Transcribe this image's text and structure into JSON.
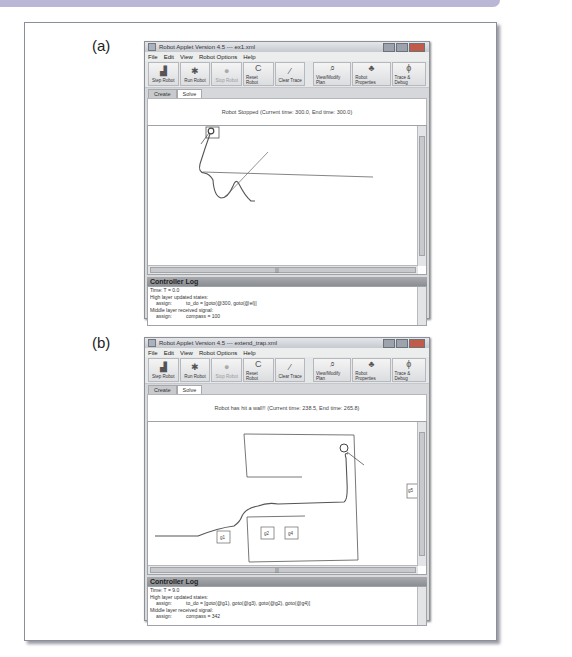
{
  "figure": {
    "panels": [
      {
        "label": "(a)",
        "window": {
          "title": "Robot Applet Version 4.5 --- ex1.xml",
          "menu": [
            "File",
            "Edit",
            "View",
            "Robot Options",
            "Help"
          ],
          "toolbar": [
            {
              "label": "Step Robot",
              "icon": "bar-chart-icon",
              "glyph": "▟",
              "enabled": true
            },
            {
              "label": "Run Robot",
              "icon": "running-man-icon",
              "glyph": "🏃",
              "enabled": true
            },
            {
              "label": "Stop Robot",
              "icon": "stop-circle-icon",
              "glyph": "●",
              "enabled": false
            },
            {
              "label": "Reset Robot",
              "icon": "reset-icon",
              "glyph": "C",
              "enabled": true
            },
            {
              "label": "Clear Trace",
              "icon": "pen-icon",
              "glyph": "⁄",
              "enabled": true
            },
            {
              "label": "View/Modify Plan",
              "icon": "magnifier-icon",
              "glyph": "⌕",
              "enabled": true
            },
            {
              "label": "Robot Properties",
              "icon": "robot-icon",
              "glyph": "♣",
              "enabled": true
            },
            {
              "label": "Trace & Debug",
              "icon": "bug-icon",
              "glyph": "ϕ",
              "enabled": true
            }
          ],
          "tabs": [
            {
              "label": "Create",
              "active": false
            },
            {
              "label": "Solve",
              "active": true
            }
          ],
          "status": "Robot Stopped (Current time: 300.0, End time: 300.0)",
          "log": {
            "title": "Controller Log",
            "lines": [
              {
                "text": "Time:   T = 0.0",
                "indent": false
              },
              {
                "text": "High layer updated states:",
                "indent": false
              },
              {
                "key": "assign:",
                "value": "to_do = [goto(@300, goto(@el)]",
                "indent": true
              },
              {
                "text": "Middle layer received signal:",
                "indent": false
              },
              {
                "key": "assign:",
                "value": "compass = 100",
                "indent": true
              }
            ]
          }
        }
      },
      {
        "label": "(b)",
        "window": {
          "title": "Robot Applet Version 4.5 --- extend_trap.xml",
          "menu": [
            "File",
            "Edit",
            "View",
            "Robot Options",
            "Help"
          ],
          "toolbar": [
            {
              "label": "Step Robot",
              "icon": "bar-chart-icon",
              "glyph": "▟",
              "enabled": true
            },
            {
              "label": "Run Robot",
              "icon": "running-man-icon",
              "glyph": "🏃",
              "enabled": true
            },
            {
              "label": "Stop Robot",
              "icon": "stop-circle-icon",
              "glyph": "●",
              "enabled": false
            },
            {
              "label": "Reset Robot",
              "icon": "reset-icon",
              "glyph": "C",
              "enabled": true
            },
            {
              "label": "Clear Trace",
              "icon": "pen-icon",
              "glyph": "⁄",
              "enabled": true
            },
            {
              "label": "View/Modify Plan",
              "icon": "magnifier-icon",
              "glyph": "⌕",
              "enabled": true
            },
            {
              "label": "Robot Properties",
              "icon": "robot-icon",
              "glyph": "♣",
              "enabled": true
            },
            {
              "label": "Trace & Debug",
              "icon": "bug-icon",
              "glyph": "ϕ",
              "enabled": true
            }
          ],
          "tabs": [
            {
              "label": "Create",
              "active": false
            },
            {
              "label": "Solve",
              "active": true
            }
          ],
          "status": "Robot has hit a wall!! (Current time: 238.5, End time: 265.8)",
          "goals": [
            "g1",
            "g2",
            "g4",
            "g5"
          ],
          "log": {
            "title": "Controller Log",
            "lines": [
              {
                "text": "Time:   T = 9.0",
                "indent": false
              },
              {
                "text": "High layer updated states:",
                "indent": false
              },
              {
                "key": "assign:",
                "value": "to_do = [goto(@g1), goto(@g3), goto(@g2), goto(@g4)]",
                "indent": true
              },
              {
                "text": "Middle layer received signal:",
                "indent": false
              },
              {
                "key": "assign:",
                "value": "compass = 342",
                "indent": true
              }
            ]
          }
        }
      }
    ]
  }
}
